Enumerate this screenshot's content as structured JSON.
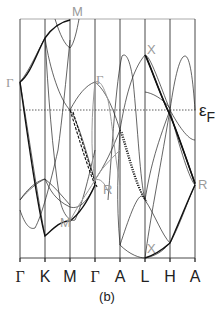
{
  "figure": {
    "caption": "(b)",
    "x_axis_ticks": [
      {
        "label": "Γ",
        "x": 20
      },
      {
        "label": "K",
        "x": 45
      },
      {
        "label": "M",
        "x": 70
      },
      {
        "label": "Γ",
        "x": 95
      },
      {
        "label": "A",
        "x": 120
      },
      {
        "label": "L",
        "x": 145
      },
      {
        "label": "H",
        "x": 170
      },
      {
        "label": "A",
        "x": 195
      }
    ],
    "fermi_level": {
      "label_main": "ε",
      "label_sub": "F",
      "y": 110
    },
    "point_labels": {
      "gamma_left": "Γ",
      "m_top": "M",
      "gamma_gray": "Γ",
      "x_top": "X",
      "r_mid": "R",
      "r_right": "R",
      "m_bottom": "M",
      "x_bottom": "X"
    },
    "colors": {
      "frame": "#333333",
      "top_border": "#a0a0a0",
      "band": "#222222",
      "highlight_gray": "#9a9a9a"
    }
  }
}
